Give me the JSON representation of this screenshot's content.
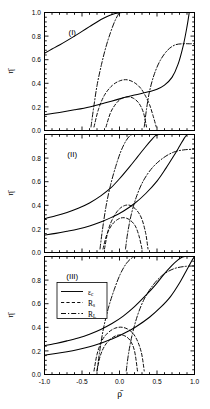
{
  "figure": {
    "type": "multi-panel-line-plot",
    "panels": 3,
    "background": "#ffffff",
    "line_color": "#000000"
  },
  "axes": {
    "xlabel": "ρ̄",
    "ylabel": "η̄",
    "xlim": [
      -1.0,
      1.0
    ],
    "ylim": [
      0.0,
      1.0
    ],
    "xticks": [
      -1.0,
      -0.5,
      0.0,
      0.5,
      1.0
    ],
    "xticklabels": [
      "-1.0",
      "-0.5",
      "0.0",
      "0.5",
      "1.0"
    ],
    "yticks": [
      0.0,
      0.2,
      0.4,
      0.6,
      0.8,
      1.0
    ],
    "yticklabels": [
      "0.0",
      "0.2",
      "0.4",
      "0.6",
      "0.8",
      "1.0"
    ],
    "xminor_per_major": 5,
    "yminor_per_major": 5,
    "grid": false,
    "tick_direction": "in"
  },
  "panel_labels": [
    "(I)",
    "(II)",
    "(III)"
  ],
  "legend": {
    "position": "upper-left-panel-III",
    "entries": [
      {
        "label": "ε_c",
        "style": "solid"
      },
      {
        "label": "R_s",
        "style": "dashed"
      },
      {
        "label": "R_L",
        "style": "dashdot"
      }
    ]
  },
  "chart_data": {
    "type": "line",
    "title": "",
    "xlabel": "ρ̄",
    "ylabel": "η̄",
    "xlim": [
      -1.0,
      1.0
    ],
    "ylim": [
      0.0,
      1.0
    ],
    "grid": false,
    "legend": [
      "ε_c",
      "R_s",
      "R_L"
    ],
    "panels": [
      {
        "name": "(I)",
        "series": [
          {
            "name": "ε_c upper",
            "style": "solid",
            "x": [
              -1.0,
              -0.9,
              -0.8,
              -0.7,
              -0.6,
              -0.5,
              -0.4,
              -0.3,
              -0.2,
              -0.1,
              0.0,
              0.05
            ],
            "y": [
              0.655,
              0.69,
              0.725,
              0.762,
              0.8,
              0.84,
              0.88,
              0.92,
              0.955,
              0.983,
              0.998,
              1.0
            ]
          },
          {
            "name": "ε_c lower",
            "style": "solid",
            "x": [
              -1.0,
              -0.8,
              -0.6,
              -0.4,
              -0.2,
              0.0,
              0.2,
              0.4,
              0.5,
              0.6,
              0.7,
              0.78,
              0.85,
              0.9,
              0.93
            ],
            "y": [
              0.133,
              0.153,
              0.175,
              0.2,
              0.233,
              0.268,
              0.3,
              0.33,
              0.35,
              0.385,
              0.45,
              0.56,
              0.72,
              0.88,
              1.0
            ]
          },
          {
            "name": "R_s left dome",
            "style": "dashed",
            "x": [
              -0.34,
              -0.28,
              -0.2,
              -0.1,
              0.0,
              0.1,
              0.2,
              0.28,
              0.34,
              0.4,
              0.45,
              0.49
            ],
            "y": [
              0.03,
              0.18,
              0.3,
              0.38,
              0.42,
              0.43,
              0.405,
              0.36,
              0.3,
              0.22,
              0.12,
              0.03
            ]
          },
          {
            "name": "R_s inner dome",
            "style": "dashed",
            "x": [
              -0.18,
              -0.12,
              -0.05,
              0.02,
              0.1,
              0.18,
              0.26,
              0.32,
              0.36
            ],
            "y": [
              0.03,
              0.15,
              0.225,
              0.268,
              0.285,
              0.275,
              0.23,
              0.15,
              0.03
            ]
          },
          {
            "name": "R_L left branch",
            "style": "dashdot",
            "x": [
              -0.38,
              -0.35,
              -0.3,
              -0.24,
              -0.18,
              -0.12,
              -0.06,
              0.0,
              0.04
            ],
            "y": [
              0.03,
              0.17,
              0.38,
              0.56,
              0.71,
              0.83,
              0.93,
              0.998,
              1.0
            ]
          },
          {
            "name": "R_L right branch",
            "style": "dashdot",
            "x": [
              0.33,
              0.36,
              0.4,
              0.46,
              0.54,
              0.64,
              0.74,
              0.84,
              0.93,
              1.0
            ],
            "y": [
              0.03,
              0.18,
              0.33,
              0.47,
              0.59,
              0.68,
              0.725,
              0.735,
              0.735,
              0.735
            ]
          }
        ]
      },
      {
        "name": "(II)",
        "series": [
          {
            "name": "ε_c upper",
            "style": "solid",
            "x": [
              -1.0,
              -0.85,
              -0.7,
              -0.55,
              -0.4,
              -0.25,
              -0.12,
              0.0,
              0.12,
              0.24,
              0.34,
              0.42,
              0.48,
              0.52
            ],
            "y": [
              0.288,
              0.312,
              0.34,
              0.375,
              0.42,
              0.48,
              0.545,
              0.625,
              0.715,
              0.81,
              0.89,
              0.95,
              0.99,
              1.0
            ]
          },
          {
            "name": "ε_c lower",
            "style": "solid",
            "x": [
              -1.0,
              -0.85,
              -0.7,
              -0.55,
              -0.4,
              -0.25,
              -0.1,
              0.05,
              0.2,
              0.35,
              0.5,
              0.62,
              0.72,
              0.8,
              0.86,
              0.9
            ],
            "y": [
              0.148,
              0.162,
              0.18,
              0.2,
              0.225,
              0.258,
              0.3,
              0.35,
              0.415,
              0.5,
              0.605,
              0.715,
              0.815,
              0.9,
              0.965,
              1.0
            ]
          },
          {
            "name": "R_s dome outer",
            "style": "dashed",
            "x": [
              -0.2,
              -0.15,
              -0.08,
              0.0,
              0.08,
              0.16,
              0.24,
              0.3,
              0.35,
              0.38
            ],
            "y": [
              0.03,
              0.19,
              0.3,
              0.37,
              0.4,
              0.395,
              0.35,
              0.28,
              0.16,
              0.03
            ]
          },
          {
            "name": "R_s dome inner",
            "style": "dashed",
            "x": [
              -0.22,
              -0.17,
              -0.1,
              -0.02,
              0.06,
              0.14,
              0.21,
              0.26,
              0.3
            ],
            "y": [
              0.03,
              0.15,
              0.235,
              0.282,
              0.295,
              0.275,
              0.225,
              0.14,
              0.03
            ]
          },
          {
            "name": "R_L left branch",
            "style": "dashdot",
            "x": [
              -0.26,
              -0.23,
              -0.18,
              -0.12,
              -0.05,
              0.02,
              0.09,
              0.15,
              0.2
            ],
            "y": [
              0.03,
              0.18,
              0.39,
              0.57,
              0.73,
              0.86,
              0.95,
              0.995,
              1.0
            ]
          },
          {
            "name": "R_L right branch",
            "style": "dashdot",
            "x": [
              0.08,
              0.11,
              0.16,
              0.23,
              0.32,
              0.44,
              0.58,
              0.72,
              0.86,
              1.0
            ],
            "y": [
              0.03,
              0.17,
              0.33,
              0.48,
              0.61,
              0.72,
              0.8,
              0.85,
              0.87,
              0.875
            ]
          }
        ]
      },
      {
        "name": "(III)",
        "series": [
          {
            "name": "ε_c upper",
            "style": "solid",
            "x": [
              -1.0,
              -0.85,
              -0.7,
              -0.55,
              -0.4,
              -0.25,
              -0.1,
              0.05,
              0.2,
              0.35,
              0.48,
              0.6,
              0.7,
              0.78,
              0.84,
              0.88
            ],
            "y": [
              0.245,
              0.263,
              0.285,
              0.31,
              0.342,
              0.382,
              0.432,
              0.495,
              0.575,
              0.67,
              0.76,
              0.855,
              0.925,
              0.972,
              0.995,
              1.0
            ]
          },
          {
            "name": "ε_c lower",
            "style": "solid",
            "x": [
              -1.0,
              -0.85,
              -0.7,
              -0.55,
              -0.4,
              -0.25,
              -0.1,
              0.05,
              0.22,
              0.4,
              0.55,
              0.68,
              0.8,
              0.9,
              0.96,
              1.0
            ],
            "y": [
              0.165,
              0.178,
              0.193,
              0.212,
              0.235,
              0.265,
              0.3,
              0.345,
              0.405,
              0.485,
              0.57,
              0.66,
              0.775,
              0.89,
              0.96,
              1.0
            ]
          },
          {
            "name": "R_s dome outer",
            "style": "dashed",
            "x": [
              -0.34,
              -0.3,
              -0.24,
              -0.16,
              -0.06,
              0.04,
              0.14,
              0.22,
              0.29,
              0.33
            ],
            "y": [
              0.03,
              0.17,
              0.28,
              0.35,
              0.392,
              0.4,
              0.372,
              0.31,
              0.19,
              0.03
            ]
          },
          {
            "name": "R_s dome inner",
            "style": "dashed",
            "x": [
              -0.3,
              -0.26,
              -0.2,
              -0.12,
              -0.03,
              0.06,
              0.14,
              0.2,
              0.24
            ],
            "y": [
              0.03,
              0.15,
              0.24,
              0.3,
              0.332,
              0.33,
              0.29,
              0.2,
              0.03
            ]
          },
          {
            "name": "R_L left branch",
            "style": "dashdot",
            "x": [
              -0.3,
              -0.27,
              -0.22,
              -0.15,
              -0.07,
              0.01,
              0.09,
              0.16,
              0.21,
              0.24
            ],
            "y": [
              0.03,
              0.17,
              0.37,
              0.56,
              0.72,
              0.85,
              0.94,
              0.985,
              0.998,
              1.0
            ]
          },
          {
            "name": "R_L right branch",
            "style": "dashdot",
            "x": [
              0.09,
              0.12,
              0.17,
              0.24,
              0.33,
              0.45,
              0.58,
              0.72,
              0.86,
              1.0
            ],
            "y": [
              0.03,
              0.175,
              0.34,
              0.5,
              0.64,
              0.76,
              0.845,
              0.895,
              0.915,
              0.92
            ]
          }
        ]
      }
    ]
  }
}
